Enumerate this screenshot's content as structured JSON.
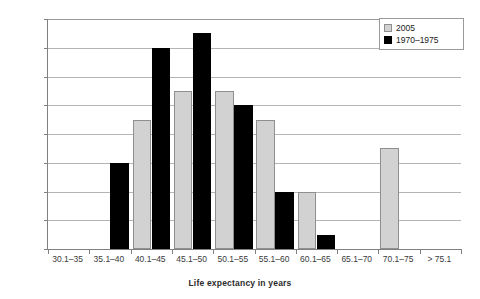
{
  "chart_data": {
    "type": "bar",
    "title": "",
    "xlabel": "Life expectancy in years",
    "ylabel": "Frequency",
    "ylim": [
      0,
      16
    ],
    "yticks": [
      0,
      2,
      4,
      6,
      8,
      10,
      12,
      14,
      16
    ],
    "grid": true,
    "legend_position": "top-right",
    "categories": [
      "30.1–35",
      "35.1–40",
      "40.1–45",
      "45.1–50",
      "50.1–55",
      "55.1–60",
      "60.1–65",
      "65.1–70",
      "70.1–75",
      "> 75.1"
    ],
    "series": [
      {
        "name": "2005",
        "color": "#d2d2d2",
        "border": "#8f8f8f",
        "values": [
          0,
          0,
          9,
          11,
          11,
          9,
          4,
          0,
          7,
          0
        ]
      },
      {
        "name": "1970–1975",
        "color": "#000000",
        "border": "#000000",
        "values": [
          0,
          6,
          14,
          15,
          10,
          4,
          1,
          0,
          0,
          0
        ]
      }
    ]
  },
  "legend": {
    "entries": [
      {
        "label": "2005"
      },
      {
        "label": "1970–1975"
      }
    ]
  }
}
